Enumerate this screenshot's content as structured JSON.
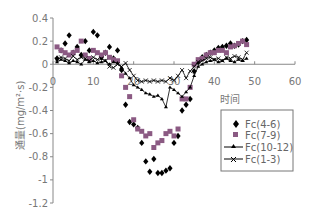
{
  "chart_data": {
    "type": "scatter",
    "title": "",
    "xlabel": "时间",
    "ylabel": "通量(mg/m²·s)",
    "xlim": [
      0,
      60
    ],
    "ylim": [
      -1.2,
      0.4
    ],
    "x_ticks": [
      "0",
      "10",
      "20",
      "30",
      "40",
      "50",
      "60"
    ],
    "y_ticks": [
      "0.4",
      "0.2",
      "0",
      "-0.2",
      "-0.4",
      "-0.6",
      "-0.8",
      "-1",
      "-1.2"
    ],
    "grid": false,
    "legend_position": "lower-right-inside",
    "series": [
      {
        "name": "Fc(4-6)",
        "marker": "diamond",
        "line": false,
        "color": "#000000",
        "x": [
          1,
          2,
          3,
          4,
          5,
          6,
          7,
          8,
          9,
          10,
          11,
          12,
          13,
          14,
          15,
          16,
          17,
          18,
          19,
          20,
          21,
          22,
          23,
          24,
          25,
          26,
          27,
          28,
          29,
          30,
          31,
          32,
          33,
          34,
          35,
          36,
          37,
          38,
          39,
          40,
          41,
          42,
          43,
          44,
          45,
          46,
          47,
          48
        ],
        "y": [
          0.05,
          0.12,
          0.18,
          0.25,
          0.1,
          0.15,
          0.08,
          0.2,
          0.12,
          0.28,
          0.25,
          0.06,
          0.1,
          0.15,
          0.05,
          0.12,
          -0.05,
          -0.35,
          -0.5,
          -0.52,
          -0.55,
          -0.68,
          -0.84,
          -0.93,
          -0.82,
          -0.94,
          -0.94,
          -0.92,
          -0.9,
          -0.68,
          -0.62,
          -0.4,
          -0.35,
          -0.3,
          -0.06,
          0.02,
          0.06,
          0.08,
          0.1,
          0.12,
          0.14,
          0.15,
          0.16,
          0.18,
          0.16,
          0.17,
          0.2,
          0.21
        ]
      },
      {
        "name": "Fc(7-9)",
        "marker": "square",
        "line": false,
        "color": "#8b5a83",
        "x": [
          1,
          2,
          3,
          4,
          5,
          6,
          7,
          8,
          9,
          10,
          11,
          12,
          13,
          14,
          15,
          16,
          17,
          18,
          19,
          20,
          21,
          22,
          23,
          24,
          25,
          26,
          27,
          28,
          29,
          30,
          31,
          32,
          33,
          34,
          35,
          36,
          37,
          38,
          39,
          40,
          41,
          42,
          43,
          44,
          45,
          46,
          47,
          48
        ],
        "y": [
          0.15,
          0.12,
          0.1,
          0.08,
          0.1,
          0.12,
          0.2,
          0.08,
          0.05,
          0.12,
          0.1,
          0.08,
          0.1,
          0.06,
          0.04,
          0.03,
          -0.1,
          -0.2,
          -0.28,
          -0.48,
          -0.56,
          -0.58,
          -0.62,
          -0.6,
          -0.72,
          -0.68,
          -0.66,
          -0.6,
          -0.58,
          -0.62,
          -0.56,
          -0.3,
          -0.3,
          -0.2,
          0.0,
          0.04,
          0.05,
          0.08,
          0.1,
          0.1,
          0.12,
          0.12,
          0.1,
          0.15,
          0.16,
          0.18,
          0.2,
          0.17
        ]
      },
      {
        "name": "Fc(10-12)",
        "marker": "triangle",
        "line": true,
        "color": "#000000",
        "x": [
          1,
          2,
          3,
          4,
          5,
          6,
          7,
          8,
          9,
          10,
          11,
          12,
          13,
          14,
          15,
          16,
          17,
          18,
          19,
          20,
          21,
          22,
          23,
          24,
          25,
          26,
          27,
          28,
          29,
          30,
          31,
          32,
          33,
          34,
          35,
          36,
          37,
          38,
          39,
          40,
          41,
          42,
          43,
          44,
          45,
          46,
          47,
          48
        ],
        "y": [
          0.02,
          0.04,
          0.03,
          0.01,
          0.03,
          0.02,
          0.0,
          0.04,
          0.02,
          0.03,
          0.01,
          0.02,
          0.03,
          0.0,
          0.02,
          0.01,
          -0.03,
          -0.08,
          -0.12,
          -0.18,
          -0.2,
          -0.22,
          -0.25,
          -0.26,
          -0.28,
          -0.27,
          -0.3,
          -0.37,
          -0.2,
          -0.22,
          -0.25,
          -0.28,
          -0.24,
          -0.2,
          -0.1,
          -0.02,
          0.0,
          0.02,
          0.03,
          0.04,
          0.02,
          0.03,
          0.05,
          0.03,
          0.02,
          0.04,
          0.03,
          0.05
        ]
      },
      {
        "name": "Fc(1-3)",
        "marker": "x",
        "line": true,
        "color": "#000000",
        "x": [
          1,
          2,
          3,
          4,
          5,
          6,
          7,
          8,
          9,
          10,
          11,
          12,
          13,
          14,
          15,
          16,
          17,
          18,
          19,
          20,
          21,
          22,
          23,
          24,
          25,
          26,
          27,
          28,
          29,
          30,
          31,
          32,
          33,
          34,
          35,
          36,
          37,
          38,
          39,
          40,
          41,
          42,
          43,
          44,
          45,
          46,
          47,
          48
        ],
        "y": [
          0.04,
          0.06,
          0.05,
          0.03,
          0.07,
          0.04,
          0.06,
          0.05,
          0.03,
          0.06,
          0.04,
          0.05,
          0.03,
          -0.02,
          -0.03,
          0.0,
          -0.02,
          0.01,
          -0.05,
          -0.1,
          -0.14,
          -0.15,
          -0.14,
          -0.15,
          -0.14,
          -0.15,
          -0.14,
          -0.15,
          -0.12,
          -0.14,
          -0.1,
          -0.05,
          -0.12,
          -0.06,
          -0.02,
          0.02,
          0.03,
          0.05,
          0.06,
          0.04,
          0.05,
          0.03,
          0.06,
          0.05,
          0.07,
          0.06,
          0.04,
          0.1
        ]
      }
    ]
  },
  "legend": {
    "items": [
      {
        "label": "Fc(4-6)",
        "marker": "diamond"
      },
      {
        "label": "Fc(7-9)",
        "marker": "square"
      },
      {
        "label": "Fc(10-12)",
        "marker": "triangle-line"
      },
      {
        "label": "Fc(1-3)",
        "marker": "x-line"
      }
    ]
  },
  "colors": {
    "axis": "#888888",
    "diamond": "#000000",
    "square": "#8b5a83",
    "line": "#000000"
  }
}
